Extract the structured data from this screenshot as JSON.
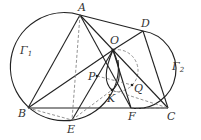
{
  "diagram": {
    "colors": {
      "stroke": "#222222",
      "dashed": "#777777",
      "label": "#333333",
      "background": "#ffffff"
    },
    "circles": [
      {
        "name": "Gamma1",
        "label": "Γ",
        "sub": "1",
        "cx": 60,
        "cy": 70,
        "r": 54
      },
      {
        "name": "Gamma2",
        "label": "Γ",
        "sub": "2",
        "cx": 150,
        "cy": 74,
        "r": 36
      }
    ],
    "points": {
      "A": {
        "label": "A",
        "x": 80,
        "y": 15
      },
      "D": {
        "label": "D",
        "x": 143,
        "y": 31
      },
      "O": {
        "label": "O",
        "x": 113,
        "y": 50
      },
      "B": {
        "label": "B",
        "x": 28,
        "y": 108
      },
      "E": {
        "label": "E",
        "x": 72,
        "y": 120
      },
      "P": {
        "label": "P",
        "x": 97,
        "y": 76
      },
      "K": {
        "label": "K",
        "x": 112,
        "y": 90
      },
      "Q": {
        "label": "Q",
        "x": 132,
        "y": 85
      },
      "F": {
        "label": "F",
        "x": 131,
        "y": 108
      },
      "C": {
        "label": "C",
        "x": 168,
        "y": 108
      }
    }
  }
}
